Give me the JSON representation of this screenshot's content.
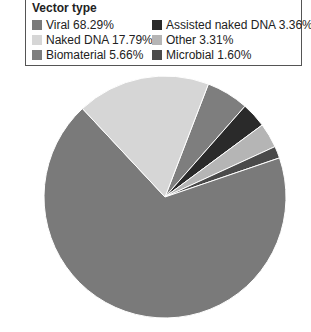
{
  "chart_data": {
    "type": "pie",
    "title": "Vector type",
    "categories": [
      "Viral",
      "Naked DNA",
      "Biomaterial",
      "Assisted naked DNA",
      "Other",
      "Microbial"
    ],
    "values": [
      68.29,
      17.79,
      5.66,
      3.36,
      3.31,
      1.6
    ],
    "unit": "%",
    "colors": [
      "#7a7a7a",
      "#d6d6d6",
      "#7e7e7e",
      "#2a2a2a",
      "#b5b5b5",
      "#4a4a4a"
    ],
    "legend_position": "top",
    "legend_labels": [
      "Viral 68.29%",
      "Naked DNA 17.79%",
      "Biomaterial 5.66%",
      "Assisted naked DNA 3.36%",
      "Other 3.31%",
      "Microbial 1.60%"
    ]
  },
  "legend": {
    "title": "Vector type",
    "items": [
      {
        "label": "Viral 68.29%",
        "color": "#7a7a7a"
      },
      {
        "label": "Naked DNA 17.79%",
        "color": "#d6d6d6"
      },
      {
        "label": "Biomaterial 5.66%",
        "color": "#7e7e7e"
      },
      {
        "label": "Assisted naked DNA 3.36%",
        "color": "#2a2a2a"
      },
      {
        "label": "Other 3.31%",
        "color": "#b5b5b5"
      },
      {
        "label": "Microbial 1.60%",
        "color": "#4a4a4a"
      }
    ]
  }
}
